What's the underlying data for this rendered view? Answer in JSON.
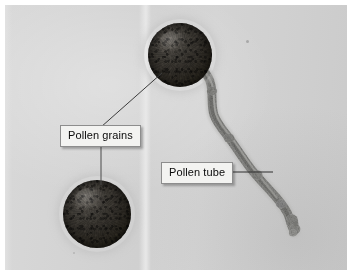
{
  "figure": {
    "kind": "light-micrograph",
    "background_color": "#d3d3d3",
    "border_color": "#ffffff"
  },
  "labels": [
    {
      "id": "pollen-grains",
      "text": "Pollen grains",
      "box_color": "#f3f3f1",
      "border_color": "#8d8d8d",
      "text_color": "#0a0a0a"
    },
    {
      "id": "pollen-tube",
      "text": "Pollen tube",
      "box_color": "#f3f3f1",
      "border_color": "#8d8d8d",
      "text_color": "#0a0a0a"
    }
  ],
  "specimens": [
    {
      "id": "grain-upper",
      "name": "Pollen grain (germinated, upper)",
      "shape": "sphere",
      "color": "#2b2823",
      "center_x": 175,
      "center_y": 50,
      "radius": 32
    },
    {
      "id": "grain-lower",
      "name": "Pollen grain (lower)",
      "shape": "sphere",
      "color": "#2b2823",
      "center_x": 92,
      "center_y": 209,
      "radius": 34
    },
    {
      "id": "pollen-tube",
      "name": "Pollen tube",
      "shape": "winding-tube",
      "color": "#8e8e8b",
      "start_x": 201,
      "start_y": 70,
      "end_x": 289,
      "end_y": 226
    }
  ],
  "leaders": [
    {
      "id": "leader-grain-upper",
      "from": "label-pollen-grains",
      "to": "grain-upper",
      "color": "#3a3a3a"
    },
    {
      "id": "leader-grain-lower",
      "from": "label-pollen-grains",
      "to": "grain-lower",
      "color": "#3a3a3a"
    },
    {
      "id": "leader-tube",
      "from": "label-pollen-tube",
      "to": "pollen-tube",
      "color": "#2e2e2e"
    }
  ],
  "artifacts": [
    {
      "id": "speck-upper-right",
      "x": 247,
      "y": 43,
      "size": 3
    },
    {
      "id": "speck-lower-left",
      "x": 74,
      "y": 255,
      "size": 2
    }
  ]
}
